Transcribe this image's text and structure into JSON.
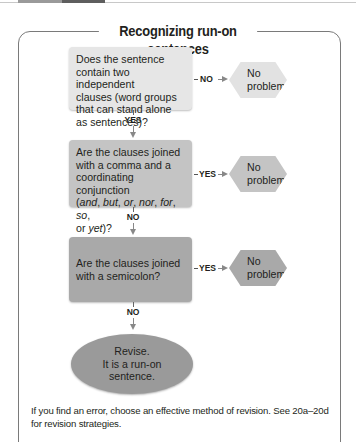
{
  "title": "Recognizing run-on sentences",
  "steps": [
    {
      "question_plain": "Does the sentence contain two independent clauses (word groups that can stand alone as sentences)?",
      "line1": "Does the sentence",
      "line2": "contain two independent",
      "line3": "clauses (word groups",
      "line4": "that can stand alone",
      "line5": "as sentences)?",
      "side_label": "NO",
      "side_result": [
        "No",
        "problem"
      ],
      "down_label": "YES"
    },
    {
      "line1": "Are the clauses joined",
      "line2": "with a comma and a",
      "line3": "coordinating conjunction",
      "conj": [
        "and",
        "but",
        "or",
        "nor",
        "for",
        "so",
        "yet"
      ],
      "side_label": "YES",
      "side_result": [
        "No",
        "problem"
      ],
      "down_label": "NO"
    },
    {
      "line1": "Are the clauses joined",
      "line2": "with a semicolon?",
      "side_label": "YES",
      "side_result": [
        "No",
        "problem"
      ],
      "down_label": "NO"
    }
  ],
  "final": [
    "Revise.",
    "It is a run-on",
    "sentence."
  ],
  "footer": "If you find an error, choose an effective method of revision. See 20a–20d for revision strategies.",
  "colors": {
    "box1": "#e6e6e6",
    "box2": "#c4c4c4",
    "box3": "#a9a9a9",
    "final": "#9a9a9a",
    "frame": "#7a7a7a"
  }
}
